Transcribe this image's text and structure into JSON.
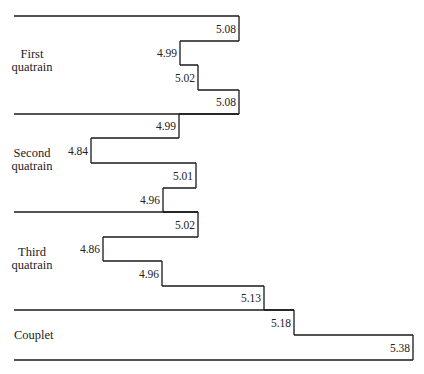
{
  "chart_data": {
    "type": "line",
    "subtype": "step",
    "title": "",
    "xlabel": "",
    "ylabel": "",
    "grid": false,
    "legend": "none",
    "orientation": "horizontal-steps (value increases to the right, lines read top to bottom)",
    "sections": [
      {
        "name": "First quatrain",
        "label_lines": [
          "First",
          "quatrain"
        ],
        "values": [
          5.08,
          4.99,
          5.02,
          5.08
        ]
      },
      {
        "name": "Second quatrain",
        "label_lines": [
          "Second",
          "quatrain"
        ],
        "values": [
          4.99,
          4.84,
          5.01,
          4.96
        ]
      },
      {
        "name": "Third quatrain",
        "label_lines": [
          "Third",
          "quatrain"
        ],
        "values": [
          5.02,
          4.86,
          4.96,
          5.13
        ]
      },
      {
        "name": "Couplet",
        "label_lines": [
          "Couplet"
        ],
        "values": [
          5.18,
          5.38
        ]
      }
    ],
    "categories": [
      "Line 1",
      "Line 2",
      "Line 3",
      "Line 4",
      "Line 5",
      "Line 6",
      "Line 7",
      "Line 8",
      "Line 9",
      "Line 10",
      "Line 11",
      "Line 12",
      "Line 13",
      "Line 14"
    ],
    "values": [
      5.08,
      4.99,
      5.02,
      5.08,
      4.99,
      4.84,
      5.01,
      4.96,
      5.02,
      4.86,
      4.96,
      5.13,
      5.18,
      5.38
    ],
    "value_labels": [
      "5.08",
      "4.99",
      "5.02",
      "5.08",
      "4.99",
      "4.84",
      "5.01",
      "4.96",
      "5.02",
      "4.86",
      "4.96",
      "5.13",
      "5.18",
      "5.38"
    ],
    "xlim": [
      4.7,
      5.45
    ]
  },
  "layout": {
    "step_x": [
      239,
      180,
      198,
      239,
      179,
      91,
      196,
      163,
      198,
      103,
      162,
      264,
      294,
      413
    ],
    "row_top": [
      16,
      41,
      65,
      90,
      114,
      138,
      163,
      188,
      212,
      237,
      261,
      286,
      310,
      335
    ],
    "row_height": 24.6,
    "bottom_y": 360,
    "left_x": 14,
    "section_separators_y": [
      16,
      114,
      212,
      310,
      360
    ],
    "section_label_y": [
      [
        58,
        71
      ],
      [
        157,
        170
      ],
      [
        256,
        269
      ],
      [
        339
      ]
    ],
    "line_color": "#1a1a1a"
  }
}
